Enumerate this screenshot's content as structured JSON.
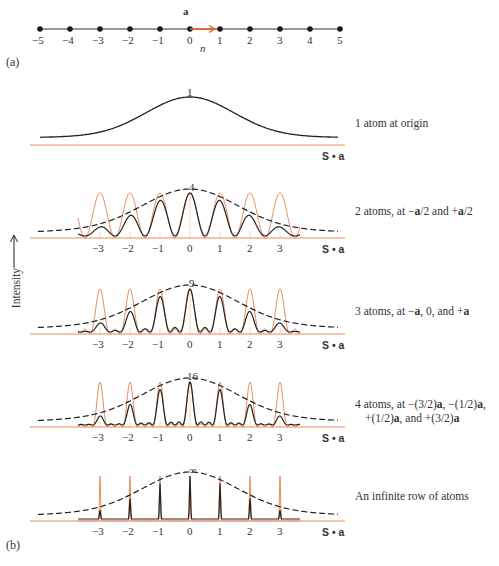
{
  "part_a": {
    "label": "(a)",
    "axis_label": "n",
    "vector_label": "a",
    "positions": [
      -5,
      -4,
      -3,
      -2,
      -1,
      0,
      1,
      2,
      3,
      4,
      5
    ],
    "tick_labels": [
      "−5",
      "−4",
      "−3",
      "−2",
      "−1",
      "0",
      "1",
      "2",
      "3",
      "4",
      "5"
    ]
  },
  "part_b": {
    "label": "(b)",
    "y_axis_label": "Intensity",
    "x_axis_label": "S • a",
    "tick_labels": [
      "−3",
      "−2",
      "−1",
      "0",
      "1",
      "2",
      "3"
    ]
  },
  "captions": {
    "p1": "1 atom at origin",
    "p2_a": "2 atoms, at −",
    "p2_b": "a",
    "p2_c": "/2 and +",
    "p2_d": "a",
    "p2_e": "/2",
    "p3_a": "3 atoms, at −",
    "p3_b": "a",
    "p3_c": ", 0, and +",
    "p3_d": "a",
    "p4_l1_a": "4 atoms, at −(3/2)",
    "p4_l1_b": "a",
    "p4_l1_c": ", −(1/2)",
    "p4_l1_d": "a",
    "p4_l1_e": ",",
    "p4_l2_a": "+(1/2)",
    "p4_l2_b": "a",
    "p4_l2_c": ", and +(3/2)",
    "p4_l2_d": "a",
    "p5": "An infinite row of atoms"
  },
  "colors": {
    "lattice": "#e8895a",
    "curve": "#222222",
    "envelope": "#222222",
    "dot": "#1a1a1a",
    "arrow": "#e8602a"
  },
  "chart_data": {
    "type": "line",
    "xlabel": "S • a",
    "ylabel": "Intensity",
    "x_ticks": [
      -3,
      -2,
      -1,
      0,
      1,
      2,
      3
    ],
    "panels": [
      {
        "N": 1,
        "peak_label": "1",
        "caption": "1 atom at origin"
      },
      {
        "N": 2,
        "peak_label": "4",
        "caption": "2 atoms, at −a/2 and +a/2"
      },
      {
        "N": 3,
        "peak_label": "9",
        "caption": "3 atoms, at −a, 0, and +a"
      },
      {
        "N": 4,
        "peak_label": "16",
        "caption": "4 atoms, at −(3/2)a, −(1/2)a, +(1/2)a, and +(3/2)a"
      },
      {
        "N": "infinite",
        "peak_label": "∞",
        "caption": "An infinite row of atoms"
      }
    ],
    "envelope": "single-atom form factor (bell-shaped, max at 0)",
    "interference_function": "sin²(Nπx)/sin²(πx), normalized, peaks at integer x"
  }
}
